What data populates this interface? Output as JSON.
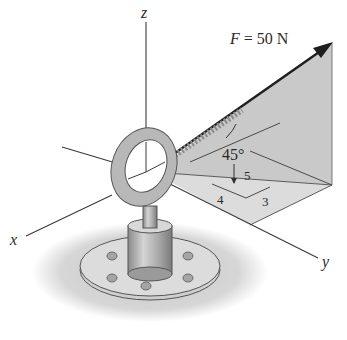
{
  "figure": {
    "force_label": "F = 50 N",
    "force_symbol": "F",
    "force_value": "50 N",
    "angle_label": "45°",
    "slope_triangle": {
      "hyp": "5",
      "leg_a": "4",
      "leg_b": "3"
    },
    "axes": {
      "x": "x",
      "y": "y",
      "z": "z"
    }
  },
  "colors": {
    "line": "#3a3a3a",
    "plane_vertical": "#c9c9c9",
    "plane_horizontal": "#dcdcdc",
    "arrow": "#1e1e1e",
    "ground": "#d2d2d2",
    "metal": "#bdbdbd"
  }
}
